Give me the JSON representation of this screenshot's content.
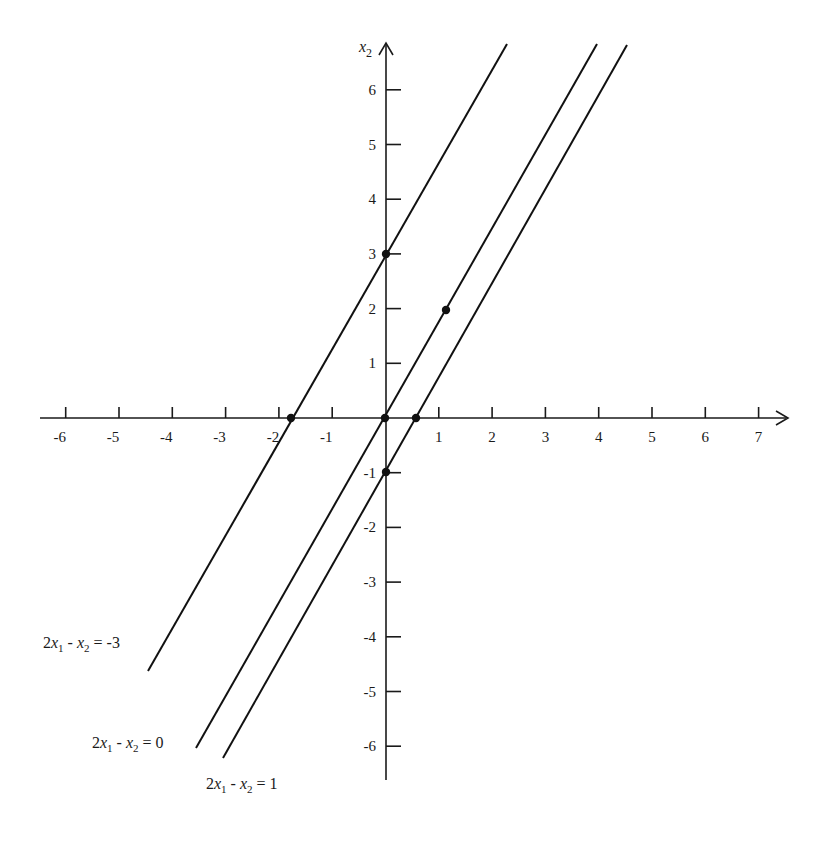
{
  "chart_data": {
    "type": "line",
    "title": "",
    "xlabel": "",
    "ylabel": "x2",
    "ylabel_display": {
      "base": "x",
      "sub": "2"
    },
    "xlim": [
      -6.5,
      7.6
    ],
    "ylim": [
      -6.6,
      6.9
    ],
    "grid": false,
    "x_ticks": [
      -6,
      -5,
      -4,
      -3,
      -2,
      -1,
      1,
      2,
      3,
      4,
      5,
      6,
      7
    ],
    "x_tick_labels": [
      "-6",
      "-5",
      "-4",
      "-3",
      "-2",
      "-1",
      "1",
      "2",
      "3",
      "4",
      "5",
      "6",
      "7"
    ],
    "y_ticks": [
      6,
      5,
      4,
      3,
      2,
      1,
      -1,
      -2,
      -3,
      -4,
      -5,
      -6
    ],
    "y_tick_labels": [
      "6",
      "5",
      "4",
      "3",
      "2",
      "1",
      "-1",
      "-2",
      "-3",
      "-4",
      "-5",
      "-6"
    ],
    "series": [
      {
        "name": "2x1 - x2 = -3",
        "equation": "x2 = 2*x1 + 3",
        "label_parts": {
          "coef": "2",
          "rhs": "-3"
        },
        "x": [
          -4.5,
          2.3
        ],
        "y": [
          -4.6,
          6.9
        ]
      },
      {
        "name": "2x1 - x2 = 0",
        "equation": "x2 = 2*x1",
        "label_parts": {
          "coef": "2",
          "rhs": "0"
        },
        "x": [
          -3.5,
          4.0
        ],
        "y": [
          -6.1,
          6.9
        ]
      },
      {
        "name": "2x1 - x2 = 1",
        "equation": "x2 = 2*x1 - 1",
        "label_parts": {
          "coef": "2",
          "rhs": "1"
        },
        "x": [
          -3.0,
          4.6
        ],
        "y": [
          -6.2,
          6.9
        ]
      }
    ],
    "points": [
      {
        "x": 0,
        "y": 3
      },
      {
        "x": -1.5,
        "y": 0
      },
      {
        "x": 0,
        "y": 0
      },
      {
        "x": 1,
        "y": 2
      },
      {
        "x": 0.5,
        "y": 0
      },
      {
        "x": 0,
        "y": -1
      }
    ],
    "legend": "inline labels at lower-left ends of lines"
  }
}
